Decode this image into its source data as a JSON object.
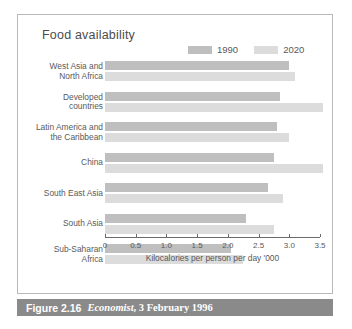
{
  "figure": {
    "title": "Food availability",
    "caption_figure": "Figure 2.16",
    "caption_source": "Economist",
    "caption_rest": ", 3 February 1996"
  },
  "legend": {
    "position": "top-right",
    "entries": [
      {
        "label": "1990",
        "color": "#bfbfbf",
        "icon": "legend-swatch-1990"
      },
      {
        "label": "2020",
        "color": "#dcdcdc",
        "icon": "legend-swatch-2020"
      }
    ]
  },
  "axis": {
    "title": "Kilocalories per person per day '000",
    "ticks": [
      "0",
      "0.5",
      "1.0",
      "1.5",
      "2.0",
      "2.5",
      "3.0",
      "3.5"
    ]
  },
  "colors": {
    "bar_1990": "#bfbfbf",
    "bar_2020": "#dcdcdc",
    "panel_border": "#b9b9b9",
    "caption_bar": "#8a8a8a",
    "text": "#59595b",
    "axis_line": "#6b6b6b"
  },
  "chart_data": {
    "type": "bar",
    "orientation": "horizontal",
    "title": "Food availability",
    "xlabel": "Kilocalories per person per day '000",
    "ylabel": "",
    "xlim": [
      0,
      3.5
    ],
    "grid": false,
    "legend_position": "top-right",
    "categories": [
      "West Asia and\nNorth Africa",
      "Developed\ncountries",
      "Latin America and\nthe Caribbean",
      "China",
      "South East Asia",
      "South Asia",
      "Sub-Saharan\nAfrica"
    ],
    "series": [
      {
        "name": "1990",
        "color": "#bfbfbf",
        "values": [
          3.0,
          2.85,
          2.8,
          2.75,
          2.65,
          2.3,
          2.05
        ]
      },
      {
        "name": "2020",
        "color": "#dcdcdc",
        "values": [
          3.1,
          3.55,
          3.0,
          3.55,
          2.9,
          2.75,
          2.25
        ]
      }
    ]
  },
  "rows": [
    {
      "label_line1": "West Asia and",
      "label_line2": "North Africa"
    },
    {
      "label_line1": "Developed",
      "label_line2": "countries"
    },
    {
      "label_line1": "Latin America and",
      "label_line2": "the Caribbean"
    },
    {
      "label_line1": "China",
      "label_line2": ""
    },
    {
      "label_line1": "South East Asia",
      "label_line2": ""
    },
    {
      "label_line1": "South Asia",
      "label_line2": ""
    },
    {
      "label_line1": "Sub-Saharan",
      "label_line2": "Africa"
    }
  ]
}
